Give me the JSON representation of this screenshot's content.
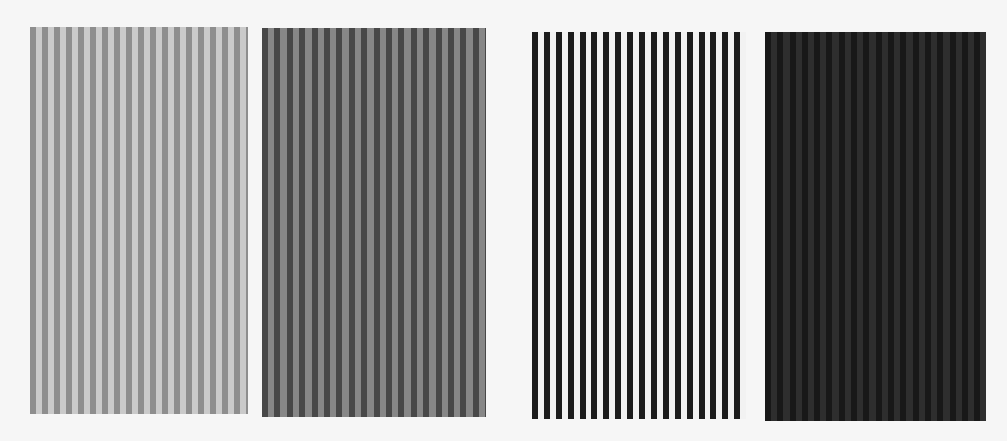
{
  "background": "#f6f6f6",
  "panels": [
    {
      "name": "light-gray-stripes",
      "left": 30,
      "top": 27,
      "width": 218,
      "height": 387,
      "color_a": "#8e8e8e",
      "color_b": "#cacaca",
      "stripe_a_width": 6,
      "period": 12
    },
    {
      "name": "mid-gray-stripes",
      "left": 262,
      "top": 28,
      "width": 224,
      "height": 389,
      "color_a": "#484848",
      "color_b": "#878787",
      "stripe_a_width": 6,
      "period": 12.4
    },
    {
      "name": "black-white-stripes",
      "left": 532,
      "top": 32,
      "width": 214,
      "height": 387,
      "color_a": "#1c1c1c",
      "color_b": "#f2f2f2",
      "stripe_a_width": 6,
      "period": 11.9
    },
    {
      "name": "dark-stripes",
      "left": 765,
      "top": 32,
      "width": 221,
      "height": 389,
      "color_a": "#181818",
      "color_b": "#2e2e2e",
      "stripe_a_width": 6,
      "period": 12.3
    }
  ]
}
